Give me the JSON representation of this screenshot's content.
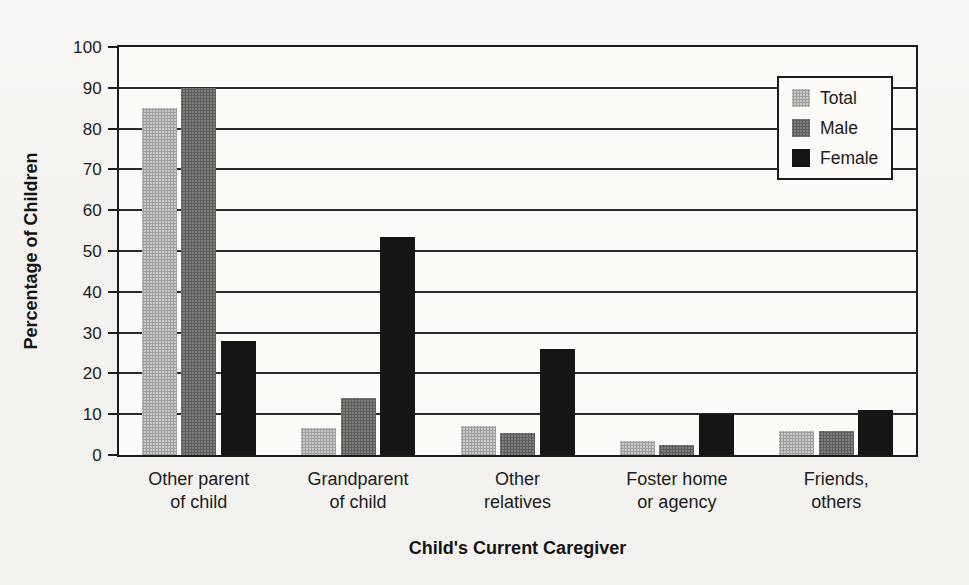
{
  "page": {
    "background_tint": "#f3f2ee"
  },
  "chart_data": {
    "type": "bar",
    "title": "",
    "categories": [
      "Other parent\nof child",
      "Grandparent\nof child",
      "Other\nrelatives",
      "Foster home\nor agency",
      "Friends,\nothers"
    ],
    "series": [
      {
        "name": "Total",
        "color": "#c6c6c6",
        "values": [
          85,
          6.5,
          7,
          3.5,
          6
        ]
      },
      {
        "name": "Male",
        "color": "#757575",
        "values": [
          90,
          14,
          5.5,
          2.5,
          6
        ]
      },
      {
        "name": "Female",
        "color": "#151515",
        "values": [
          28,
          53.5,
          26,
          10,
          11
        ]
      }
    ],
    "xlabel": "Child's Current Caregiver",
    "ylabel": "Percentage of Children",
    "ylim": [
      0,
      100
    ],
    "ytick_step": 10,
    "yticks": [
      0,
      10,
      20,
      30,
      40,
      50,
      60,
      70,
      80,
      90,
      100
    ],
    "grid": true,
    "legend_position": "upper right",
    "axis_color": "#1c1c1c",
    "plot_background": "#fbfaf6"
  }
}
